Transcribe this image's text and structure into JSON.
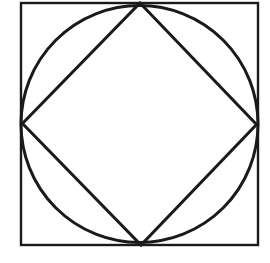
{
  "canvas": {
    "width": 270,
    "height": 263,
    "background_color": "#ffffff",
    "description": "Line drawing of a square with an inscribed circle and an inscribed diamond (square rotated 45 degrees)"
  },
  "figure": {
    "stroke_color": "#1a1a1a",
    "fill": "none",
    "shapes": [
      {
        "id": "outer-square",
        "type": "rect",
        "x": 21,
        "y": 3,
        "width": 237,
        "height": 242,
        "stroke_width": 2.4,
        "fill": "none"
      },
      {
        "id": "inscribed-circle",
        "type": "circle",
        "cx": 139.5,
        "cy": 124,
        "r": 118.5,
        "stroke_width": 3.0,
        "fill": "none"
      },
      {
        "id": "inscribed-diamond",
        "type": "polygon",
        "points": "140,3 256.5,124.5 141,245 22.5,123.5",
        "stroke_width": 3.0,
        "fill": "none"
      }
    ],
    "vertices": [
      {
        "id": "diamond-top-vertex",
        "x": 140,
        "y": 3
      },
      {
        "id": "diamond-right-vertex",
        "x": 256.5,
        "y": 124.5
      },
      {
        "id": "diamond-bottom-vertex",
        "x": 141,
        "y": 245
      },
      {
        "id": "diamond-left-vertex",
        "x": 22.5,
        "y": 123.5
      }
    ]
  }
}
